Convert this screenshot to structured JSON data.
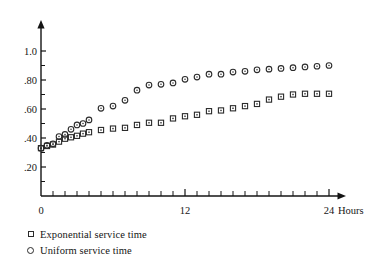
{
  "chart_data": {
    "type": "scatter",
    "title": "",
    "xlabel": "Hours",
    "ylabel": "",
    "xlim": [
      0,
      24
    ],
    "ylim": [
      0,
      1.08
    ],
    "grid": false,
    "legend_position": "below-left",
    "x_tick_labels": [
      "0",
      "12",
      "24"
    ],
    "x_tick_values": [
      0,
      12,
      24
    ],
    "x_minor_tick_count": 24,
    "y_tick_labels": [
      "1.0",
      ".80",
      ".60",
      ".40",
      ".20"
    ],
    "y_tick_values": [
      1.0,
      0.8,
      0.6,
      0.4,
      0.2
    ],
    "x_axis_unit_label": "Hours",
    "series": [
      {
        "name": "Exponential service time",
        "marker": "square",
        "x": [
          0,
          0.5,
          1,
          1.5,
          2,
          2.5,
          3,
          3.5,
          4,
          5,
          6,
          7,
          8,
          9,
          10,
          11,
          12,
          13,
          14,
          15,
          16,
          17,
          18,
          19,
          20,
          21,
          22,
          23,
          24
        ],
        "values": [
          0.33,
          0.345,
          0.355,
          0.375,
          0.395,
          0.405,
          0.415,
          0.43,
          0.44,
          0.455,
          0.465,
          0.47,
          0.49,
          0.505,
          0.505,
          0.535,
          0.55,
          0.56,
          0.585,
          0.59,
          0.605,
          0.62,
          0.635,
          0.665,
          0.685,
          0.7,
          0.705,
          0.705,
          0.705
        ]
      },
      {
        "name": "Uniform service time",
        "marker": "circle",
        "x": [
          0,
          0.5,
          1,
          1.5,
          2,
          2.5,
          3,
          3.5,
          4,
          5,
          6,
          7,
          8,
          9,
          10,
          11,
          12,
          13,
          14,
          15,
          16,
          17,
          18,
          19,
          20,
          21,
          22,
          23,
          24
        ],
        "values": [
          0.33,
          0.35,
          0.36,
          0.41,
          0.425,
          0.46,
          0.49,
          0.5,
          0.525,
          0.605,
          0.62,
          0.66,
          0.73,
          0.765,
          0.77,
          0.78,
          0.805,
          0.82,
          0.84,
          0.84,
          0.855,
          0.86,
          0.87,
          0.875,
          0.88,
          0.885,
          0.89,
          0.895,
          0.9
        ]
      }
    ]
  },
  "legend": {
    "entries": [
      {
        "marker": "square",
        "label": "Exponential service time"
      },
      {
        "marker": "circle",
        "label": "Uniform service time"
      }
    ]
  },
  "axes": {
    "x_label_left": "0",
    "x_label_mid": "12",
    "x_label_right": "24",
    "x_unit": "Hours",
    "y_labels": [
      "1.0",
      ".80",
      ".60",
      ".40",
      ".20"
    ]
  }
}
